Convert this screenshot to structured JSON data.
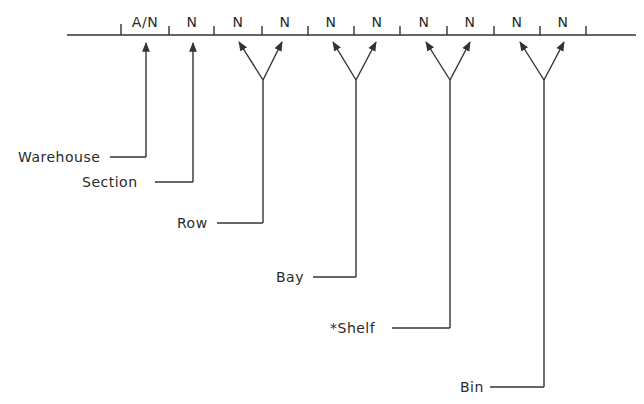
{
  "diagram": {
    "title": "",
    "fields": [
      "A/N",
      "N",
      "N",
      "N",
      "N",
      "N",
      "N",
      "N",
      "N",
      "N"
    ],
    "labels": {
      "warehouse": "Warehouse",
      "section": "Section",
      "row": "Row",
      "bay": "Bay",
      "shelf": "*Shelf",
      "bin": "Bin"
    },
    "line_color": "#333333"
  }
}
